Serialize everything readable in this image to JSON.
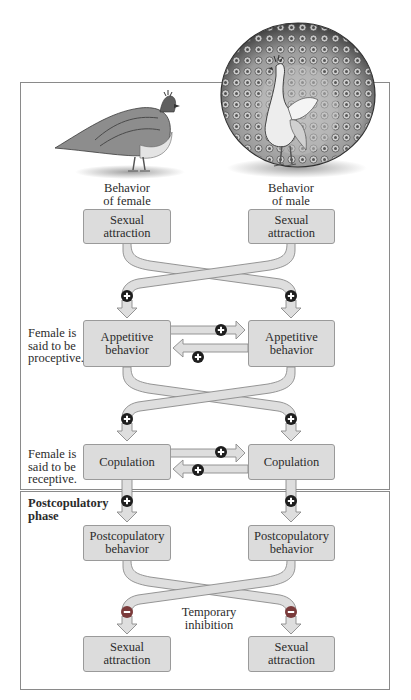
{
  "colors": {
    "box_fill": "#dcdcdc",
    "arrow_fill": "#dedede",
    "arrow_stroke": "#8a8a8a",
    "plus_fill": "#1e1e1e",
    "minus_fill": "#7a3a3a",
    "frame": "#8a8a8a"
  },
  "header": {
    "female_label_1": "Behavior",
    "female_label_2": "of female",
    "male_label_1": "Behavior",
    "male_label_2": "of male"
  },
  "illustrations": {
    "female": "peahen",
    "male": "peacock-with-fanned-tail"
  },
  "female_column": {
    "sexual_attraction": [
      "Sexual",
      "attraction"
    ],
    "appetitive": [
      "Appetitive",
      "behavior"
    ],
    "copulation": "Copulation",
    "postcopulatory": [
      "Postcopulatory",
      "behavior"
    ],
    "sexual_attraction_after": [
      "Sexual",
      "attraction"
    ]
  },
  "male_column": {
    "sexual_attraction": [
      "Sexual",
      "attraction"
    ],
    "appetitive": [
      "Appetitive",
      "behavior"
    ],
    "copulation": "Copulation",
    "postcopulatory": [
      "Postcopulatory",
      "behavior"
    ],
    "sexual_attraction_after": [
      "Sexual",
      "attraction"
    ]
  },
  "side_notes": {
    "proceptive": [
      "Female is",
      "said to be",
      "proceptive."
    ],
    "receptive": [
      "Female is",
      "said to be",
      "receptive."
    ]
  },
  "phases": {
    "postcopulatory_1": "Postcopulatory",
    "postcopulatory_2": "phase"
  },
  "annotations": {
    "inhibition_1": "Temporary",
    "inhibition_2": "inhibition"
  },
  "signs": {
    "positive": "+",
    "negative": "−"
  }
}
